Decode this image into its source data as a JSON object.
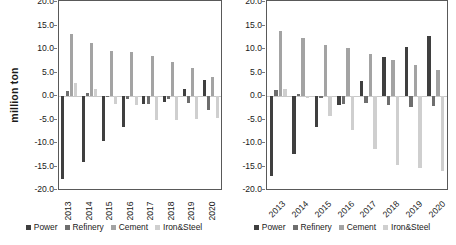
{
  "figure": {
    "ylabel": "million ton",
    "series_names": [
      "Power",
      "Refinery",
      "Cement",
      "Iron&Steel"
    ],
    "colors": {
      "Power": "#3f3f3f",
      "Refinery": "#6e6e6e",
      "Cement": "#a3a3a3",
      "Iron&Steel": "#cfcfcf",
      "axis": "#595959",
      "zeroline": "#c9c9c9",
      "text": "#1a1a1a"
    }
  },
  "chart_data": [
    {
      "type": "bar",
      "id": "left-chart",
      "title": "",
      "xlabel": "",
      "ylabel": "million ton",
      "ylim": [
        -20.0,
        20.0
      ],
      "yticks": [
        "20.0",
        "15.0",
        "10.0",
        "5.0",
        "0.0",
        "-5.0",
        "-10.0",
        "-15.0",
        "-20.0"
      ],
      "ytick_values": [
        20.0,
        15.0,
        10.0,
        5.0,
        0.0,
        -5.0,
        -10.0,
        -15.0,
        -20.0
      ],
      "grid": false,
      "legend_position": "bottom",
      "label_rotation": -90,
      "categories": [
        "2013",
        "2014",
        "2015",
        "2016",
        "2017",
        "2018",
        "2019",
        "2020"
      ],
      "series": [
        {
          "name": "Power",
          "values": [
            -17.6,
            -14.0,
            -9.6,
            -6.6,
            -1.7,
            -1.3,
            1.4,
            3.4
          ]
        },
        {
          "name": "Refinery",
          "values": [
            1.0,
            0.6,
            -0.3,
            -0.7,
            -1.6,
            -0.6,
            -1.4,
            -2.9
          ]
        },
        {
          "name": "Cement",
          "values": [
            13.2,
            11.3,
            9.5,
            9.4,
            8.6,
            7.3,
            5.9,
            4.0
          ]
        },
        {
          "name": "Iron&Steel",
          "values": [
            2.8,
            1.4,
            -1.8,
            -2.0,
            -5.2,
            -5.1,
            -4.9,
            -4.7
          ]
        }
      ]
    },
    {
      "type": "bar",
      "id": "right-chart",
      "title": "",
      "xlabel": "",
      "ylabel": "",
      "ylim": [
        -20.0,
        20.0
      ],
      "yticks": [
        "20.0",
        "15.0",
        "10.0",
        "5.0",
        "0.0",
        "-5.0",
        "-10.0",
        "-15.0",
        "-20.0"
      ],
      "ytick_values": [
        20.0,
        15.0,
        10.0,
        5.0,
        0.0,
        -5.0,
        -10.0,
        -15.0,
        -20.0
      ],
      "grid": false,
      "legend_position": "bottom",
      "label_rotation": -45,
      "categories": [
        "2013",
        "2014",
        "2015",
        "2016",
        "2017",
        "2018",
        "2019",
        "2020"
      ],
      "series": [
        {
          "name": "Power",
          "values": [
            -17.1,
            -12.3,
            -6.6,
            -1.9,
            3.1,
            8.4,
            10.5,
            12.7
          ]
        },
        {
          "name": "Refinery",
          "values": [
            1.2,
            0.4,
            -0.5,
            -1.7,
            -1.5,
            -1.9,
            -2.4,
            -2.2
          ]
        },
        {
          "name": "Cement",
          "values": [
            13.8,
            12.3,
            10.8,
            10.2,
            9.0,
            7.7,
            6.6,
            5.5
          ]
        },
        {
          "name": "Iron&Steel",
          "values": [
            1.4,
            -0.4,
            -4.2,
            -7.2,
            -11.2,
            -14.7,
            -15.4,
            -16.0
          ]
        }
      ]
    }
  ]
}
